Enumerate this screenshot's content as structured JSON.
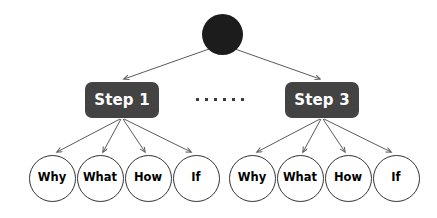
{
  "diagram": {
    "background_color": "#ffffff",
    "root": {
      "name": "root-node",
      "label": "",
      "color": "#1c1c1c",
      "shape": "circle",
      "cx": 222,
      "cy": 34,
      "r": 20.5
    },
    "ellipsis": {
      "name": "ellipsis-separator",
      "dot_count": 6,
      "color": "#3a3a3a",
      "cx": 222,
      "cy": 99
    },
    "steps": [
      {
        "id": "step-1",
        "label": "Step 1",
        "box_color": "#434343",
        "text_color": "#ffffff",
        "cx": 122,
        "cy": 100,
        "children": [
          {
            "id": "step-1-why",
            "label": "Why",
            "cx": 52,
            "cy": 178
          },
          {
            "id": "step-1-what",
            "label": "What",
            "cx": 100,
            "cy": 178
          },
          {
            "id": "step-1-how",
            "label": "How",
            "cx": 148,
            "cy": 178
          },
          {
            "id": "step-1-if",
            "label": "If",
            "cx": 196,
            "cy": 178
          }
        ]
      },
      {
        "id": "step-3",
        "label": "Step 3",
        "box_color": "#434343",
        "text_color": "#ffffff",
        "cx": 322,
        "cy": 100,
        "children": [
          {
            "id": "step-3-why",
            "label": "Why",
            "cx": 252,
            "cy": 178
          },
          {
            "id": "step-3-what",
            "label": "What",
            "cx": 300,
            "cy": 178
          },
          {
            "id": "step-3-how",
            "label": "How",
            "cx": 348,
            "cy": 178
          },
          {
            "id": "step-3-if",
            "label": "If",
            "cx": 396,
            "cy": 178
          }
        ]
      }
    ],
    "edges": {
      "color": "#5a5a5a",
      "width": 1,
      "arrowhead": "open-v"
    }
  }
}
